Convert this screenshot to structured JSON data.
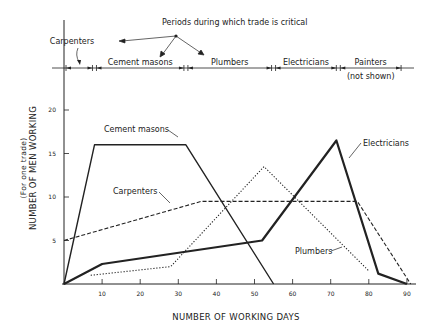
{
  "chart_data": {
    "type": "line",
    "title": "Periods during which trade is critical",
    "xlabel": "NUMBER OF WORKING DAYS",
    "ylabel": "NUMBER OF MEN WORKING",
    "ylabel_sub": "(For one trade)",
    "xlim": [
      0,
      92
    ],
    "ylim": [
      0,
      25
    ],
    "x_ticks": [
      10,
      20,
      30,
      40,
      50,
      60,
      70,
      80,
      90
    ],
    "x_tick_labels": [
      "10",
      "20",
      "30",
      "40",
      "50",
      "60",
      "70",
      "80",
      "90"
    ],
    "y_ticks": [
      5,
      10,
      15,
      20
    ],
    "y_tick_labels": [
      "5",
      "10",
      "15",
      "20"
    ],
    "grid": false,
    "legend": "inline labels with arrows",
    "series": [
      {
        "name": "Cement masons",
        "style": "solid",
        "points": [
          [
            0,
            0
          ],
          [
            8,
            16
          ],
          [
            32,
            16
          ],
          [
            55,
            0
          ]
        ]
      },
      {
        "name": "Carpenters",
        "style": "dashed",
        "points": [
          [
            0,
            5
          ],
          [
            36,
            9.5
          ],
          [
            77,
            9.5
          ],
          [
            91,
            0
          ]
        ]
      },
      {
        "name": "Plumbers",
        "style": "dotted",
        "points": [
          [
            7,
            1
          ],
          [
            28,
            2
          ],
          [
            52.5,
            13.5
          ],
          [
            80,
            1.5
          ]
        ]
      },
      {
        "name": "Electricians",
        "style": "heavy",
        "points": [
          [
            0,
            0
          ],
          [
            10,
            2.3
          ],
          [
            52,
            5
          ],
          [
            71.5,
            16.5
          ],
          [
            82.5,
            1.2
          ],
          [
            90,
            0
          ]
        ]
      }
    ],
    "critical_periods": [
      {
        "label": "Carpenters",
        "start": 0,
        "end": 8
      },
      {
        "label": "Cement masons",
        "start": 8,
        "end": 32
      },
      {
        "label": "Plumbers",
        "start": 32,
        "end": 55
      },
      {
        "label": "Electricians",
        "start": 55,
        "end": 72
      },
      {
        "label": "Painters",
        "sublabel": "(not shown)",
        "start": 72,
        "end": 89
      }
    ],
    "annotations": [
      {
        "text": "Cement masons",
        "x": 26,
        "y": 17,
        "target_series": "Cement masons"
      },
      {
        "text": "Carpenters",
        "x": 20,
        "y": 11,
        "target_series": "Carpenters"
      },
      {
        "text": "Plumbers",
        "x": 66,
        "y": 4,
        "target_series": "Plumbers"
      },
      {
        "text": "Electricians",
        "x": 82,
        "y": 15,
        "target_series": "Electricians"
      }
    ]
  },
  "colors": {
    "ink": "#222222",
    "background": "#ffffff"
  }
}
